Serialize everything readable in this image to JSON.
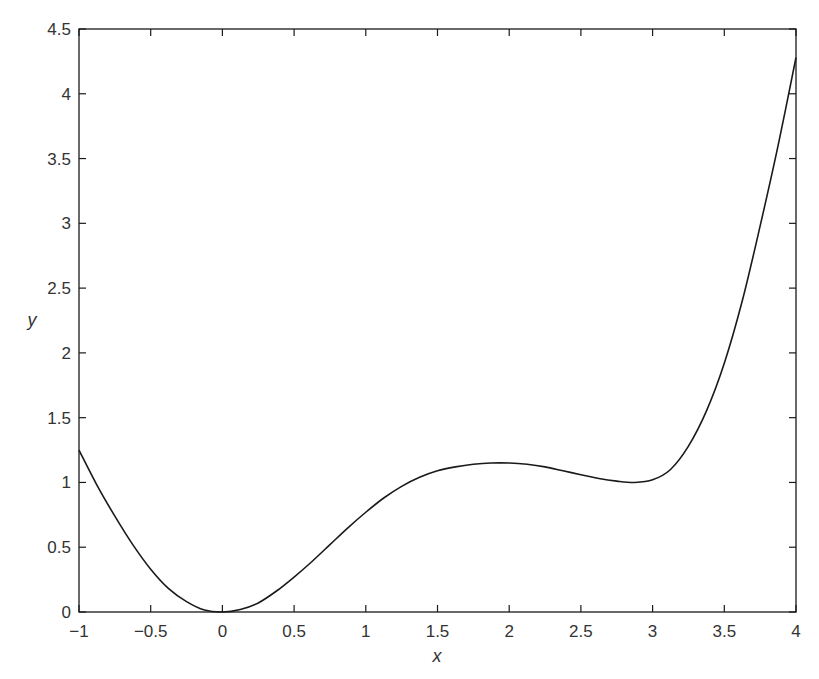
{
  "chart_data": {
    "type": "line",
    "title": "",
    "xlabel": "x",
    "ylabel": "y",
    "xlim": [
      -1,
      4
    ],
    "ylim": [
      0,
      4.5
    ],
    "grid": false,
    "legend": null,
    "xticks": [
      -1,
      -0.5,
      0,
      0.5,
      1,
      1.5,
      2,
      2.5,
      3,
      3.5,
      4
    ],
    "xtick_labels": [
      "−1",
      "−0.5",
      "0",
      "0.5",
      "1",
      "1.5",
      "2",
      "2.5",
      "3",
      "3.5",
      "4"
    ],
    "yticks": [
      0,
      0.5,
      1,
      1.5,
      2,
      2.5,
      3,
      3.5,
      4,
      4.5
    ],
    "ytick_labels": [
      "0",
      "0.5",
      "1",
      "1.5",
      "2",
      "2.5",
      "3",
      "3.5",
      "4",
      "4.5"
    ],
    "series": [
      {
        "name": "y(x)",
        "color": "#1a1a1a",
        "x": [
          -1,
          -0.875,
          -0.75,
          -0.625,
          -0.5,
          -0.375,
          -0.25,
          -0.125,
          0,
          0.125,
          0.25,
          0.375,
          0.5,
          0.625,
          0.75,
          0.875,
          1,
          1.125,
          1.25,
          1.375,
          1.5,
          1.625,
          1.75,
          1.875,
          2,
          2.125,
          2.25,
          2.375,
          2.5,
          2.625,
          2.75,
          2.875,
          3,
          3.125,
          3.25,
          3.375,
          3.5,
          3.625,
          3.75,
          3.875,
          4
        ],
        "y": [
          1.25,
          0.98,
          0.74,
          0.52,
          0.33,
          0.18,
          0.08,
          0.015,
          0.0,
          0.02,
          0.07,
          0.16,
          0.27,
          0.39,
          0.52,
          0.65,
          0.77,
          0.88,
          0.97,
          1.04,
          1.09,
          1.12,
          1.14,
          1.15,
          1.15,
          1.14,
          1.12,
          1.09,
          1.06,
          1.03,
          1.01,
          1.0,
          1.02,
          1.1,
          1.28,
          1.55,
          1.92,
          2.4,
          2.98,
          3.6,
          4.28
        ]
      }
    ]
  }
}
